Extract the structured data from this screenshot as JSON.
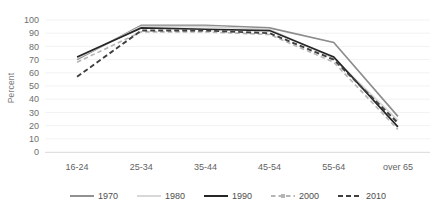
{
  "chart_data": {
    "type": "line",
    "title": "",
    "subtitle": "",
    "xlabel": "",
    "ylabel": "Percent",
    "categories": [
      "16-24",
      "25-34",
      "35-44",
      "45-54",
      "55-64",
      "over 65"
    ],
    "ylim": [
      0,
      100
    ],
    "yticks": [
      0,
      10,
      20,
      30,
      40,
      50,
      60,
      70,
      80,
      90,
      100
    ],
    "grid": true,
    "legend_position": "bottom",
    "series": [
      {
        "name": "1970",
        "values": [
          70,
          96,
          96,
          94,
          83,
          27
        ],
        "color": "#8c8c8c",
        "style": "solid",
        "width": 1.6
      },
      {
        "name": "1980",
        "values": [
          71,
          95,
          95,
          93,
          71,
          24
        ],
        "color": "#d6d6d6",
        "style": "solid",
        "width": 1.6
      },
      {
        "name": "1990",
        "values": [
          72,
          94,
          93,
          92,
          72,
          19
        ],
        "color": "#262626",
        "style": "solid",
        "width": 1.7
      },
      {
        "name": "2000",
        "values": [
          68,
          91,
          91,
          89,
          68,
          17
        ],
        "color": "#b5b5b5",
        "style": "dashed-marker",
        "width": 1.6
      },
      {
        "name": "2010",
        "values": [
          57,
          92,
          92,
          90,
          70,
          22
        ],
        "color": "#3f3f3f",
        "style": "dashed",
        "width": 1.9
      }
    ]
  },
  "axes": {
    "y_title": "Percent",
    "y_tick_labels": [
      "100",
      "90",
      "80",
      "70",
      "60",
      "50",
      "40",
      "30",
      "20",
      "10",
      "0"
    ],
    "x_tick_labels": [
      "16-24",
      "25-34",
      "35-44",
      "45-54",
      "55-64",
      "over 65"
    ]
  },
  "legend": {
    "items": [
      {
        "label": "1970"
      },
      {
        "label": "1980"
      },
      {
        "label": "1990"
      },
      {
        "label": "2000"
      },
      {
        "label": "2010"
      }
    ]
  }
}
